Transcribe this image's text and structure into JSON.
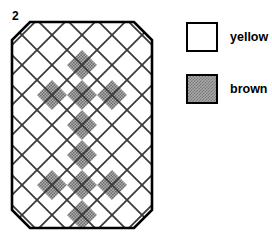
{
  "figure": {
    "number": "2",
    "caption": ""
  },
  "quilt": {
    "name": "diagonal-lattice-quilt-block",
    "shape": "octagon",
    "outline_color": "#000000",
    "lattice_line_color": "#3a3a3a",
    "cell_size_px": 30,
    "grid_cols": 5,
    "grid_rows": 7,
    "fills": {
      "yellow": "#ffffff",
      "brown": "#a8a8a8"
    },
    "cells": [
      {
        "col": 0,
        "row": 0,
        "fill": "yellow"
      },
      {
        "col": 1,
        "row": 0,
        "fill": "yellow"
      },
      {
        "col": 2,
        "row": 0,
        "fill": "yellow"
      },
      {
        "col": 3,
        "row": 0,
        "fill": "yellow"
      },
      {
        "col": 4,
        "row": 0,
        "fill": "yellow"
      },
      {
        "col": 0,
        "row": 1,
        "fill": "yellow"
      },
      {
        "col": 1,
        "row": 1,
        "fill": "yellow"
      },
      {
        "col": 2,
        "row": 1,
        "fill": "brown"
      },
      {
        "col": 3,
        "row": 1,
        "fill": "yellow"
      },
      {
        "col": 4,
        "row": 1,
        "fill": "yellow"
      },
      {
        "col": 0,
        "row": 2,
        "fill": "yellow"
      },
      {
        "col": 1,
        "row": 2,
        "fill": "brown"
      },
      {
        "col": 2,
        "row": 2,
        "fill": "brown"
      },
      {
        "col": 3,
        "row": 2,
        "fill": "brown"
      },
      {
        "col": 4,
        "row": 2,
        "fill": "yellow"
      },
      {
        "col": 0,
        "row": 3,
        "fill": "yellow"
      },
      {
        "col": 1,
        "row": 3,
        "fill": "yellow"
      },
      {
        "col": 2,
        "row": 3,
        "fill": "brown"
      },
      {
        "col": 3,
        "row": 3,
        "fill": "yellow"
      },
      {
        "col": 4,
        "row": 3,
        "fill": "yellow"
      },
      {
        "col": 0,
        "row": 4,
        "fill": "yellow"
      },
      {
        "col": 1,
        "row": 4,
        "fill": "yellow"
      },
      {
        "col": 2,
        "row": 4,
        "fill": "brown"
      },
      {
        "col": 3,
        "row": 4,
        "fill": "yellow"
      },
      {
        "col": 4,
        "row": 4,
        "fill": "yellow"
      },
      {
        "col": 0,
        "row": 5,
        "fill": "yellow"
      },
      {
        "col": 1,
        "row": 5,
        "fill": "brown"
      },
      {
        "col": 2,
        "row": 5,
        "fill": "brown"
      },
      {
        "col": 3,
        "row": 5,
        "fill": "brown"
      },
      {
        "col": 4,
        "row": 5,
        "fill": "yellow"
      },
      {
        "col": 0,
        "row": 6,
        "fill": "yellow"
      },
      {
        "col": 1,
        "row": 6,
        "fill": "yellow"
      },
      {
        "col": 2,
        "row": 6,
        "fill": "brown"
      },
      {
        "col": 3,
        "row": 6,
        "fill": "yellow"
      },
      {
        "col": 4,
        "row": 6,
        "fill": "yellow"
      }
    ]
  },
  "legend": {
    "items": [
      {
        "label": "yellow",
        "swatch": "white-square-swatch"
      },
      {
        "label": "brown",
        "swatch": "textured-square-swatch"
      }
    ]
  }
}
